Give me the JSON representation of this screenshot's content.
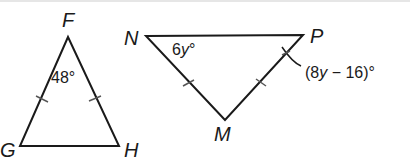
{
  "figure": {
    "triangle_left": {
      "vertices": {
        "top": "F",
        "bottom_left": "G",
        "bottom_right": "H"
      },
      "angle_label": "48°",
      "angle_at": "F",
      "congruent_sides": [
        "FG",
        "FH"
      ]
    },
    "triangle_right": {
      "vertices": {
        "top_left": "N",
        "top_right": "P",
        "bottom": "M"
      },
      "angle_N_label": "6y°",
      "angle_P_label": "(8y − 16)°",
      "congruent_sides": [
        "NM",
        "PM"
      ]
    }
  },
  "labels": {
    "F": "F",
    "G": "G",
    "H": "H",
    "N": "N",
    "P": "P",
    "M": "M",
    "angle_F": "48°",
    "angle_N_coef": "6",
    "angle_N_var": "y",
    "angle_N_deg": "°",
    "angle_P_open": "(8",
    "angle_P_var": "y",
    "angle_P_rest": " − 16)°"
  },
  "colors": {
    "stroke": "#1a1a1a",
    "tick": "#555555",
    "background": "#ffffff"
  }
}
